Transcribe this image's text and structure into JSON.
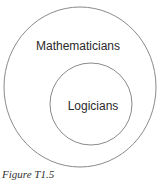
{
  "diagram": {
    "type": "euler-diagram",
    "outer_set": {
      "label": "Mathematicians",
      "cx": 80,
      "cy": 87,
      "rx": 76,
      "ry": 80
    },
    "inner_set": {
      "label": "Logicians",
      "cx": 91,
      "cy": 104,
      "r": 41
    },
    "relation": "Logicians is a subset of Mathematicians",
    "stroke_color": "#8a8a8a"
  },
  "caption": "Figure T1.5"
}
